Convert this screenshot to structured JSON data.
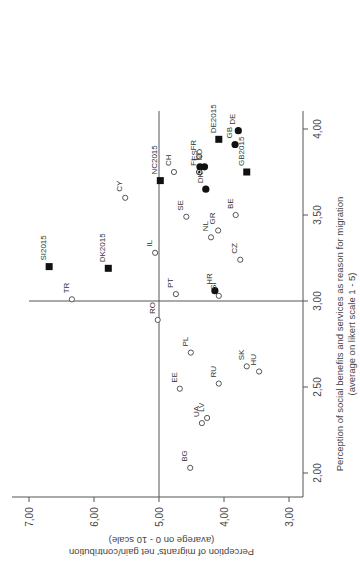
{
  "chart_data": {
    "type": "scatter",
    "title": "",
    "orientation_note": "figure rotated 90° counter-clockwise on the page",
    "xlabel": "Perception of social benefits and services as reason for migration",
    "xlabel_sub": "(average on likert scale 1 - 5)",
    "ylabel": "Perception of migrants' net gain/contribution",
    "ylabel_sub": "(avarege on 0 - 10 scale)",
    "xlim": [
      1.9,
      4.1
    ],
    "ylim": [
      2.9,
      7.2
    ],
    "x_ticks": [
      "2,00",
      "2,50",
      "3,00",
      "3,50",
      "4,00"
    ],
    "x_tick_values": [
      2.0,
      2.5,
      3.0,
      3.5,
      4.0
    ],
    "y_ticks": [
      "3,00",
      "4,00",
      "5,00",
      "6,00",
      "7,00"
    ],
    "y_tick_values": [
      3.0,
      4.0,
      5.0,
      6.0,
      7.0
    ],
    "reference_lines": {
      "x": 3.0,
      "y": 5.0
    },
    "grid": false,
    "legend": null,
    "marker_types": {
      "open_circle": "country (open)",
      "filled_circle": "country (filled)",
      "circle_dot": "country (dotted)",
      "filled_square": "2015 survey"
    },
    "points": [
      {
        "label": "DE",
        "x": 3.99,
        "y": 3.78,
        "marker": "filled_circle"
      },
      {
        "label": "DE2015",
        "x": 3.94,
        "y": 4.08,
        "marker": "filled_square"
      },
      {
        "label": "GB",
        "x": 3.91,
        "y": 3.83,
        "marker": "filled_circle"
      },
      {
        "label": "GB2015",
        "x": 3.75,
        "y": 3.65,
        "marker": "filled_square"
      },
      {
        "label": "FR",
        "x": 3.84,
        "y": 4.38,
        "marker": "open_circle"
      },
      {
        "label": "ES",
        "x": 3.78,
        "y": 4.37,
        "marker": "filled_circle"
      },
      {
        "label": "NO",
        "x": 3.78,
        "y": 4.3,
        "marker": "filled_circle"
      },
      {
        "label": "FI",
        "x": 3.75,
        "y": 4.38,
        "marker": "circle_dot"
      },
      {
        "label": "DK",
        "x": 3.65,
        "y": 4.28,
        "marker": "filled_circle"
      },
      {
        "label": "NC2015",
        "x": 3.7,
        "y": 4.98,
        "marker": "filled_square"
      },
      {
        "label": "CH",
        "x": 3.75,
        "y": 4.77,
        "marker": "open_circle"
      },
      {
        "label": "CY",
        "x": 3.6,
        "y": 5.52,
        "marker": "open_circle"
      },
      {
        "label": "SE",
        "x": 3.49,
        "y": 4.58,
        "marker": "open_circle"
      },
      {
        "label": "BE",
        "x": 3.5,
        "y": 3.82,
        "marker": "open_circle"
      },
      {
        "label": "GR",
        "x": 3.41,
        "y": 4.09,
        "marker": "open_circle"
      },
      {
        "label": "NL",
        "x": 3.37,
        "y": 4.2,
        "marker": "open_circle"
      },
      {
        "label": "CZ",
        "x": 3.24,
        "y": 3.75,
        "marker": "open_circle"
      },
      {
        "label": "IL",
        "x": 3.28,
        "y": 5.06,
        "marker": "open_circle"
      },
      {
        "label": "SI2015",
        "x": 3.2,
        "y": 6.69,
        "marker": "filled_square"
      },
      {
        "label": "DK2015",
        "x": 3.19,
        "y": 5.78,
        "marker": "filled_square"
      },
      {
        "label": "PT",
        "x": 3.04,
        "y": 4.74,
        "marker": "open_circle"
      },
      {
        "label": "HR",
        "x": 3.06,
        "y": 4.14,
        "marker": "filled_circle"
      },
      {
        "label": "SI",
        "x": 3.03,
        "y": 4.08,
        "marker": "open_circle"
      },
      {
        "label": "TR",
        "x": 3.01,
        "y": 6.34,
        "marker": "open_circle"
      },
      {
        "label": "RO",
        "x": 2.89,
        "y": 5.02,
        "marker": "open_circle"
      },
      {
        "label": "PL",
        "x": 2.7,
        "y": 4.51,
        "marker": "open_circle"
      },
      {
        "label": "SK",
        "x": 2.62,
        "y": 3.65,
        "marker": "open_circle"
      },
      {
        "label": "HU",
        "x": 2.59,
        "y": 3.46,
        "marker": "open_circle"
      },
      {
        "label": "EE",
        "x": 2.49,
        "y": 4.68,
        "marker": "open_circle"
      },
      {
        "label": "RU",
        "x": 2.52,
        "y": 4.08,
        "marker": "open_circle"
      },
      {
        "label": "LV",
        "x": 2.32,
        "y": 4.26,
        "marker": "open_circle"
      },
      {
        "label": "UA",
        "x": 2.29,
        "y": 4.34,
        "marker": "open_circle"
      },
      {
        "label": "BG",
        "x": 2.03,
        "y": 4.52,
        "marker": "open_circle"
      }
    ]
  },
  "layout": {
    "plot": {
      "x_axis_px": 303,
      "y_axis_px": 497,
      "x_val_top": 4.0,
      "x_val_top_px": 129,
      "x_px_per_unit": 172,
      "y_val_left": 7.0,
      "y_val_left_px": 29,
      "y_px_per_unit": 65,
      "top_px": 111,
      "left_px": 29
    },
    "colors": {
      "axis": "#555555",
      "marker": "#111111",
      "text": "#333333"
    }
  }
}
